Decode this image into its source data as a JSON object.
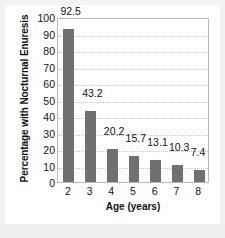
{
  "chart_data": {
    "type": "bar",
    "title": "",
    "categories": [
      "2",
      "3",
      "4",
      "5",
      "6",
      "7",
      "8"
    ],
    "values": [
      92.5,
      43.2,
      20.2,
      15.7,
      13.1,
      10.3,
      7.4
    ],
    "value_labels": [
      "92.5",
      "43.2",
      "20.2",
      "15.7",
      "13.1",
      "10.3",
      "7.4"
    ],
    "xlabel": "Age (years)",
    "ylabel": "Percentage with Nocturnal Enuresis",
    "ylim": [
      0,
      100
    ],
    "ytick_labels": [
      "100",
      "90",
      "80",
      "70",
      "60",
      "50",
      "40",
      "30",
      "20",
      "10",
      "0"
    ],
    "ytick_values": [
      100,
      90,
      80,
      70,
      60,
      50,
      40,
      30,
      20,
      10,
      0
    ],
    "grid": true,
    "legend": false,
    "bar_color": "#707070",
    "grid_color": "#c9c9c9",
    "frame_color": "#b9b9b9",
    "background": "#ffffff"
  }
}
